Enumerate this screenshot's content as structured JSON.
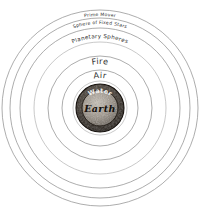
{
  "diagram": {
    "background_color": "#ffffff",
    "stroke_color": "#8a8a8a",
    "center": {
      "x": 100,
      "y": 108
    },
    "spheres": [
      {
        "name": "prime-mover",
        "label": "Prime Mover",
        "radius": 98,
        "label_radius": 92,
        "label_size": "tiny"
      },
      {
        "name": "sphere-of-fixed-stars",
        "label": "Sphere of Fixed Stars",
        "radius": 90,
        "label_radius": 84,
        "label_size": "tiny"
      },
      {
        "name": "planetary-spheres",
        "label": "Planetary Spheres",
        "radius": 80,
        "label_radius": 70,
        "label_size": "small"
      },
      {
        "name": "planetary-inner-a",
        "label": "",
        "radius": 66,
        "label_radius": 0,
        "label_size": "none"
      },
      {
        "name": "fire",
        "label": "Fire",
        "radius": 52,
        "label_radius": 44,
        "label_size": "med"
      },
      {
        "name": "air",
        "label": "Air",
        "radius": 38,
        "label_radius": 30,
        "label_size": "med"
      }
    ],
    "core": {
      "water": {
        "label": "Water",
        "radius": 24,
        "fill_color": "#3a332c",
        "text_color": "#f2f2f2"
      },
      "earth": {
        "label": "Earth",
        "radius": 18,
        "fill_color": "#9b9287",
        "text_color": "#15100c"
      }
    }
  }
}
